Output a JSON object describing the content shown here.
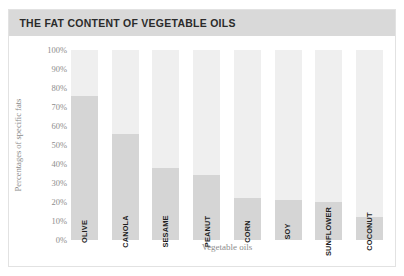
{
  "card": {
    "title": "THE FAT CONTENT OF VEGETABLE OILS",
    "accent_color": "#6aa84f",
    "title_bar_color": "#d9d9d9",
    "border_color": "#e2e2e2"
  },
  "chart_data": {
    "type": "bar",
    "title": "THE FAT CONTENT OF VEGETABLE OILS",
    "xlabel": "Vegetable oils",
    "ylabel": "Percentages of specific fats",
    "categories": [
      "OLIVE",
      "CANOLA",
      "SESAME",
      "PEANUT",
      "CORN",
      "SOY",
      "SUNFLOWER",
      "COCONUT"
    ],
    "values": [
      76,
      56,
      38,
      34,
      22,
      21,
      20,
      12
    ],
    "ylim": [
      0,
      100
    ],
    "yticks": [
      "100%",
      "90%",
      "80%",
      "70%",
      "60%",
      "50%",
      "40%",
      "30%",
      "20%",
      "10%",
      "0%"
    ],
    "ytick_values": [
      100,
      90,
      80,
      70,
      60,
      50,
      40,
      30,
      20,
      10,
      0
    ],
    "grid": false,
    "legend": "none",
    "bar_fill_color": "#d5d5d5",
    "bar_track_color": "#efefef"
  }
}
